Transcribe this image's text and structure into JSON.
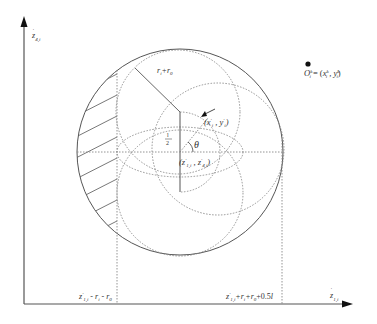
{
  "diagram": {
    "axes": {
      "y_label": {
        "main": "z",
        "sup": "'",
        "sub": "4,i"
      },
      "x_label": {
        "main": "z",
        "sup": "'",
        "sub": "1,i"
      }
    },
    "labels": {
      "radius_label": "r_i + r_0",
      "point_label": "(x'_i, y'_i)",
      "center_label": "(z'_{1,i}, z'_{4,i})",
      "half_label": "l/2",
      "angle_label": "θ",
      "destination_label": "O_i^k = (x_i^k, y_i^k)",
      "x_tick_left": "z'_{1,i} - r_i - r_0",
      "x_tick_right": "z'_{1,i} + r_i + r_0 + 0.5l"
    },
    "colors": {
      "line": "#555555",
      "dotted": "#888888",
      "text": "#333333"
    }
  }
}
